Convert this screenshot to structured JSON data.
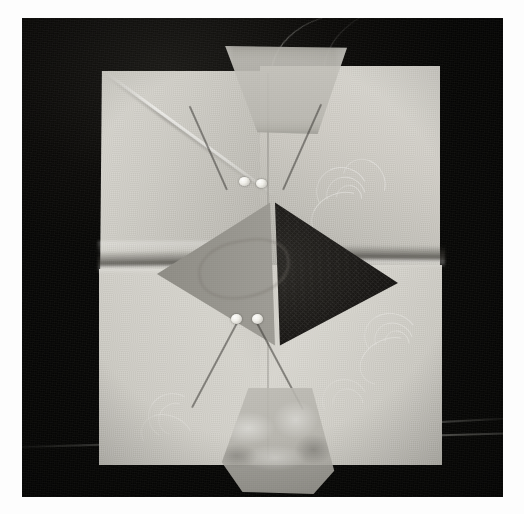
{
  "image": {
    "domain": "natural-image",
    "title": "Folded fabric square pinned into a central diamond",
    "orientation": "portrait",
    "width_px": 524,
    "height_px": 514,
    "color_mode": "grayscale / monochrome photograph",
    "border": {
      "style": "white photo print border",
      "color": "#fdfdfd",
      "inset_px": 20
    }
  },
  "palette": {
    "paper_white": "#fdfdfd",
    "backdrop_black": "#0a0a09",
    "fabric_light": "#d8d6cf",
    "fabric_mid": "#c2c0b9",
    "fabric_shadow": "#aeaca5",
    "diamond_left_gray": "#9a9891",
    "diamond_right_dark": "#201e1b",
    "pin_head_white": "#f5f4ef",
    "pin_shaft_dark": "#3a3834"
  },
  "scene": {
    "subject": "square of pale patterned fabric folded inward from four sides",
    "background": "flat black surface / dark cloth",
    "lighting": "soft diffuse light from upper left",
    "elements": [
      {
        "name": "fabric-square",
        "description": "pale ivory textile with woven damask swirl motifs"
      },
      {
        "name": "center-diamond",
        "description": "rhombus opening at the centre, left half mid-gray, right half deep shadow"
      },
      {
        "name": "flap-top",
        "description": "translucent trapezoidal flap folded down from the top edge"
      },
      {
        "name": "flap-bottom",
        "description": "crumpled translucent flap at the bottom edge"
      },
      {
        "name": "fold-left",
        "description": "horizontal fold line crossing the left panel"
      },
      {
        "name": "fold-right",
        "description": "horizontal fold line crossing the right panel"
      },
      {
        "name": "crease-upper-left",
        "description": "diagonal crease running from the upper left corner"
      },
      {
        "name": "thread",
        "description": "thin loose thread arcing across the black background at top right"
      },
      {
        "name": "backdrop-seam",
        "description": "faint diagonal highlight line low in the black background"
      }
    ]
  },
  "pins": {
    "count": 4,
    "description": "four straight pins with pearl-white heads, crossed in pairs above and below the diamond",
    "groups": [
      {
        "name": "upper-pin-pair",
        "arrangement": "crossed X with heads meeting at the diamond top vertex",
        "pins": [
          {
            "name": "pin-upper-left",
            "head_x": 246,
            "head_y": 186,
            "angle_deg": 24
          },
          {
            "name": "pin-upper-right",
            "head_x": 263,
            "head_y": 188,
            "angle_deg": -24
          }
        ]
      },
      {
        "name": "lower-pin-pair",
        "arrangement": "crossed X with heads meeting at the diamond bottom vertex",
        "pins": [
          {
            "name": "pin-lower-left",
            "head_x": 238,
            "head_y": 322,
            "angle_deg": -28
          },
          {
            "name": "pin-lower-right",
            "head_x": 260,
            "head_y": 322,
            "angle_deg": 28
          }
        ]
      }
    ]
  },
  "geometry": {
    "diamond": {
      "top_vertex": {
        "x": 254,
        "y": 185
      },
      "left_vertex": {
        "x": 137,
        "y": 252
      },
      "right_vertex": {
        "x": 355,
        "y": 268
      },
      "bottom_vertex": {
        "x": 250,
        "y": 329
      }
    },
    "fabric_bounds": {
      "left": 88,
      "top": 55,
      "right": 406,
      "bottom": 440
    }
  },
  "pattern": {
    "name": "damask swirl",
    "motifs": [
      {
        "name": "swirl-upper-right",
        "x": 300,
        "y": 150
      },
      {
        "name": "swirl-lower-right",
        "x": 350,
        "y": 300
      },
      {
        "name": "swirl-lower-left",
        "x": 150,
        "y": 395
      }
    ]
  }
}
